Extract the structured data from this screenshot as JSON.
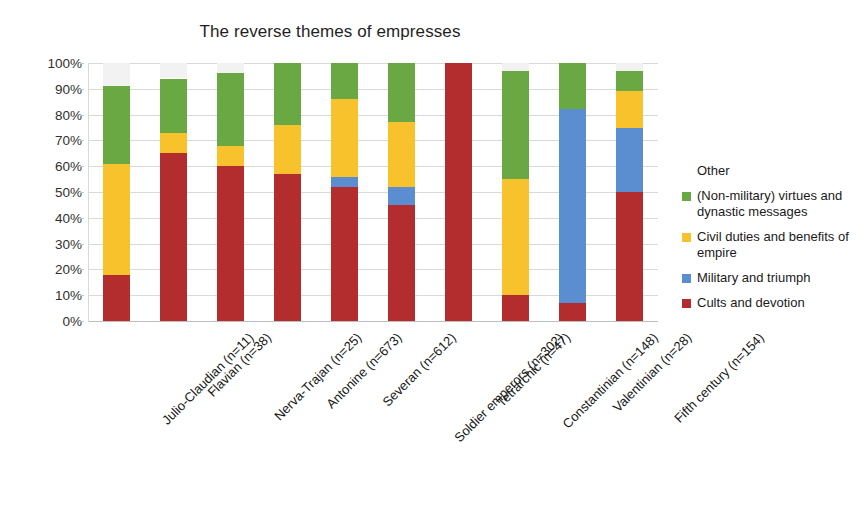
{
  "chart_data": {
    "type": "bar",
    "subtype": "stacked-percentage",
    "title": "The reverse themes of empresses",
    "xlabel": "",
    "ylabel": "",
    "ylim": [
      0,
      100
    ],
    "ytick_labels": [
      "100%",
      "90%",
      "80%",
      "70%",
      "60%",
      "50%",
      "40%",
      "30%",
      "20%",
      "10%",
      "0%"
    ],
    "ytick_values": [
      100,
      90,
      80,
      70,
      60,
      50,
      40,
      30,
      20,
      10,
      0
    ],
    "grid": true,
    "legend_position": "right",
    "categories": [
      "Julio-Claudian (n=11)",
      "Flavian (n=38)",
      "Nerva-Trajan (n=25)",
      "Antonine (n=673)",
      "Severan (n=612)",
      "Soldier emperors (n=302)",
      "Tetrarchic (n=47)",
      "Constantinian (n=148)",
      "Valentinian (n=28)",
      "Fifth century (n=154)"
    ],
    "series": [
      {
        "name": "Cults and devotion",
        "color": "#B32D2E",
        "values": [
          18,
          65,
          60,
          57,
          52,
          45,
          100,
          10,
          7,
          50
        ]
      },
      {
        "name": "Military and triumph",
        "color": "#5B8ED0",
        "values": [
          0,
          0,
          0,
          0,
          4,
          7,
          0,
          0,
          75,
          25
        ]
      },
      {
        "name": "Civil duties and benefits of empire",
        "color": "#F7C22B",
        "values": [
          43,
          8,
          8,
          19,
          30,
          25,
          0,
          45,
          0,
          14
        ]
      },
      {
        "name": "(Non-military) virtues and dynastic messages",
        "color": "#6AA843",
        "values": [
          30,
          21,
          28,
          24,
          14,
          23,
          0,
          42,
          18,
          8
        ]
      },
      {
        "name": "Other",
        "color": "#F2F2F2",
        "values": [
          9,
          6,
          4,
          0,
          0,
          0,
          0,
          3,
          0,
          3
        ]
      }
    ],
    "legend_entries": [
      {
        "label": "Other",
        "color": "#F2F2F2"
      },
      {
        "label": "(Non-military) virtues and dynastic messages",
        "color": "#6AA843"
      },
      {
        "label": "Civil duties and benefits of empire",
        "color": "#F7C22B"
      },
      {
        "label": "Military and triumph",
        "color": "#5B8ED0"
      },
      {
        "label": "Cults and devotion",
        "color": "#B32D2E"
      }
    ]
  }
}
